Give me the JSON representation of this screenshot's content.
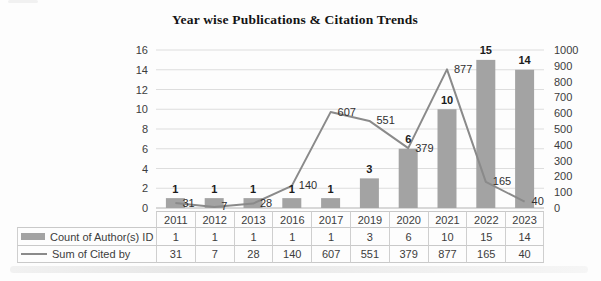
{
  "chart_data": {
    "type": "combo",
    "title": "Year wise Publications & Citation Trends",
    "categories": [
      "2011",
      "2012",
      "2013",
      "2016",
      "2017",
      "2019",
      "2020",
      "2021",
      "2022",
      "2023"
    ],
    "series": [
      {
        "name": "Count of Author(s) ID",
        "type": "bar",
        "axis": "left",
        "values": [
          1,
          1,
          1,
          1,
          1,
          3,
          6,
          10,
          15,
          14
        ],
        "color": "#a3a3a3"
      },
      {
        "name": "Sum of Cited by",
        "type": "line",
        "axis": "right",
        "values": [
          31,
          7,
          28,
          140,
          607,
          551,
          379,
          877,
          165,
          40
        ],
        "color": "#8a8a8a"
      }
    ],
    "left_axis": {
      "min": 0,
      "max": 16,
      "step": 2,
      "ticks": [
        0,
        2,
        4,
        6,
        8,
        10,
        12,
        14,
        16
      ]
    },
    "right_axis": {
      "min": 0,
      "max": 1000,
      "step": 100,
      "ticks": [
        0,
        100,
        200,
        300,
        400,
        500,
        600,
        700,
        800,
        900,
        1000
      ]
    },
    "grid": "horizontal",
    "data_labels": true,
    "legend_position": "data-table-left",
    "colors": {
      "grid": "#dddddd",
      "baseline": "#b3b3b3",
      "axis_text": "#3c3c3c"
    }
  }
}
